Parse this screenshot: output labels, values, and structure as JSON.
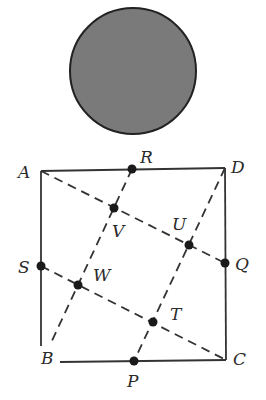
{
  "circle": {
    "cx": 133,
    "cy": 71,
    "r": 63,
    "fill": "#7a7a7a",
    "stroke": "#222222"
  },
  "square": {
    "stroke": "#333333",
    "corners": {
      "A": {
        "x": 41,
        "y": 171
      },
      "B": {
        "x": 41,
        "y": 362
      },
      "C": {
        "x": 226,
        "y": 360
      },
      "D": {
        "x": 225,
        "y": 168
      }
    }
  },
  "labels": {
    "A": "A",
    "B": "B",
    "C": "C",
    "D": "D",
    "R": "R",
    "Q": "Q",
    "P": "P",
    "S": "S",
    "V": "V",
    "U": "U",
    "W": "W",
    "T": "T"
  },
  "points": [
    {
      "name": "R",
      "x": 132,
      "y": 169
    },
    {
      "name": "Q",
      "x": 225,
      "y": 263
    },
    {
      "name": "P",
      "x": 134,
      "y": 361
    },
    {
      "name": "S",
      "x": 41,
      "y": 266
    },
    {
      "name": "V",
      "x": 114,
      "y": 208
    },
    {
      "name": "U",
      "x": 189,
      "y": 245
    },
    {
      "name": "W",
      "x": 78,
      "y": 285
    },
    {
      "name": "T",
      "x": 153,
      "y": 322
    }
  ],
  "dashed_lines": [
    {
      "from": "A",
      "to": "Q"
    },
    {
      "from": "S",
      "to": "C"
    },
    {
      "from": "R",
      "to": "B"
    },
    {
      "from": "D",
      "to": "P"
    }
  ]
}
